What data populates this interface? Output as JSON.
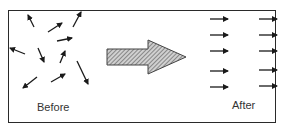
{
  "diagram": {
    "before_label": "Before",
    "after_label": "After",
    "arrow_color": "#1a1a1a",
    "frame_color": "#2a2a2a",
    "transition_arrow": {
      "fill": "#bdbdbd",
      "hatch": "#555555",
      "icon": "hatched-right-arrow"
    },
    "before_arrows": [
      {
        "x1": 34,
        "y1": 27,
        "x2": 28,
        "y2": 15
      },
      {
        "x1": 48,
        "y1": 32,
        "x2": 62,
        "y2": 23
      },
      {
        "x1": 73,
        "y1": 27,
        "x2": 81,
        "y2": 12
      },
      {
        "x1": 57,
        "y1": 41,
        "x2": 72,
        "y2": 38
      },
      {
        "x1": 25,
        "y1": 54,
        "x2": 10,
        "y2": 48
      },
      {
        "x1": 38,
        "y1": 48,
        "x2": 44,
        "y2": 62
      },
      {
        "x1": 60,
        "y1": 63,
        "x2": 65,
        "y2": 51
      },
      {
        "x1": 77,
        "y1": 61,
        "x2": 88,
        "y2": 84
      },
      {
        "x1": 37,
        "y1": 77,
        "x2": 23,
        "y2": 88
      },
      {
        "x1": 51,
        "y1": 82,
        "x2": 65,
        "y2": 74
      }
    ],
    "after_arrows": [
      {
        "x1": 210,
        "y1": 19,
        "x2": 228,
        "y2": 19
      },
      {
        "x1": 259,
        "y1": 19,
        "x2": 277,
        "y2": 19
      },
      {
        "x1": 210,
        "y1": 35,
        "x2": 228,
        "y2": 35
      },
      {
        "x1": 259,
        "y1": 35,
        "x2": 277,
        "y2": 35
      },
      {
        "x1": 210,
        "y1": 51,
        "x2": 228,
        "y2": 51
      },
      {
        "x1": 259,
        "y1": 51,
        "x2": 277,
        "y2": 51
      },
      {
        "x1": 210,
        "y1": 71,
        "x2": 228,
        "y2": 71
      },
      {
        "x1": 259,
        "y1": 70,
        "x2": 277,
        "y2": 70
      },
      {
        "x1": 210,
        "y1": 87,
        "x2": 228,
        "y2": 87
      },
      {
        "x1": 259,
        "y1": 86,
        "x2": 277,
        "y2": 86
      }
    ]
  }
}
